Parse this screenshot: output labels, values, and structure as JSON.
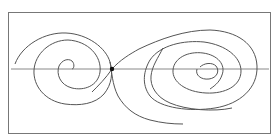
{
  "figure": {
    "kind": "phase portrait",
    "colors": {
      "stroke": "#555555",
      "frame": "#777777",
      "axis": "#888888",
      "saddle_point": "#111111",
      "background": "#ffffff"
    },
    "frame": {
      "x": 8,
      "y": 12,
      "width": 263,
      "height": 122
    },
    "axis": {
      "y": 69,
      "x1": 11,
      "x2": 269
    },
    "saddle_point": {
      "x": 112,
      "y": 69
    },
    "left_focus": {
      "x": 70,
      "y": 69
    },
    "right_focus": {
      "x": 206,
      "y": 68
    }
  }
}
